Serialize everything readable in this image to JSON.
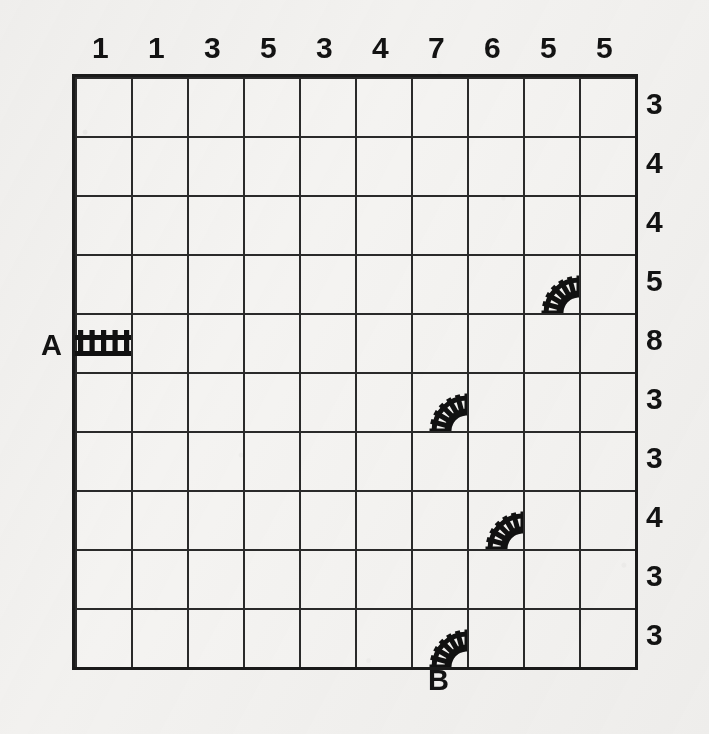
{
  "puzzle": {
    "type": "railroad-tracks-logic-puzzle",
    "grid": {
      "columns": 10,
      "rows": 10
    },
    "column_clues": [
      1,
      1,
      3,
      5,
      3,
      4,
      7,
      6,
      5,
      5
    ],
    "row_clues": [
      3,
      4,
      4,
      5,
      8,
      3,
      3,
      4,
      3,
      3
    ],
    "endpoints": [
      {
        "label": "A",
        "side": "left",
        "row": 4,
        "col": 0,
        "piece": "straight-horizontal"
      },
      {
        "label": "B",
        "side": "bottom",
        "row": 9,
        "col": 6,
        "piece": "curve"
      }
    ],
    "given_pieces": [
      {
        "id": "piece-a",
        "col": 0,
        "row": 4,
        "kind": "straight-horizontal",
        "icon": "straight-track-icon"
      },
      {
        "id": "piece-curve-1",
        "col": 8,
        "row": 3,
        "kind": "curve",
        "icon": "curved-track-icon"
      },
      {
        "id": "piece-curve-2",
        "col": 6,
        "row": 5,
        "kind": "curve",
        "icon": "curved-track-icon"
      },
      {
        "id": "piece-curve-3",
        "col": 7,
        "row": 7,
        "kind": "curve",
        "icon": "curved-track-icon"
      },
      {
        "id": "piece-curve-4",
        "col": 6,
        "row": 9,
        "kind": "curve",
        "icon": "curved-track-icon"
      }
    ],
    "colors": {
      "paper": "#f2f1ef",
      "ink": "#131313",
      "grid_line": "#2a2a2a",
      "border": "#1a1a1a"
    }
  }
}
